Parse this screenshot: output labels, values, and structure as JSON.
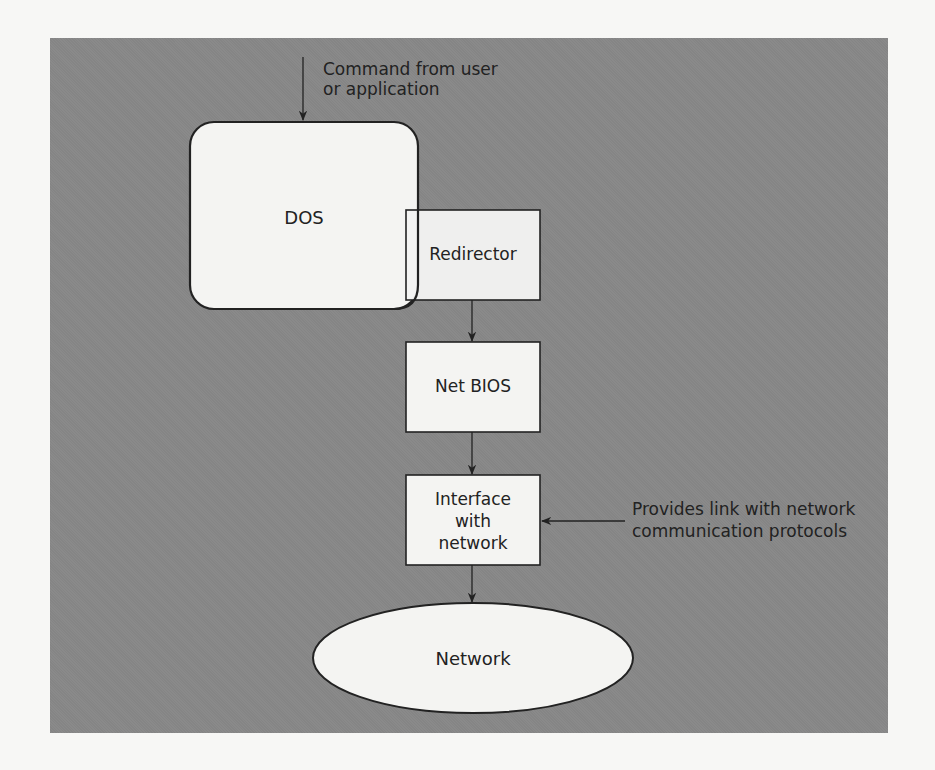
{
  "diagram": {
    "title": "",
    "annotations": {
      "command": [
        "Command from user",
        "or application"
      ],
      "protocols": [
        "Provides link with network",
        "communication protocols"
      ]
    },
    "nodes": {
      "dos": "DOS",
      "redirector": "Redirector",
      "netbios": "Net BIOS",
      "interface": [
        "Interface",
        "with",
        "network"
      ],
      "network": "Network"
    },
    "edges": [
      {
        "from": "command",
        "to": "dos"
      },
      {
        "from": "redirector",
        "to": "netbios"
      },
      {
        "from": "netbios",
        "to": "interface"
      },
      {
        "from": "protocols",
        "to": "interface"
      },
      {
        "from": "interface",
        "to": "network"
      }
    ],
    "colors": {
      "background": "#f7f7f5",
      "panel": "#8a8a8a",
      "node_fill": "#f4f4f2",
      "stroke": "#222222"
    }
  }
}
